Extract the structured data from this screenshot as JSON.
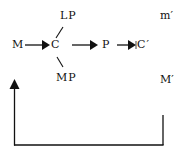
{
  "diagram": {
    "type": "circuit-of-capital flow diagram",
    "nodes": {
      "M": "M",
      "C": "C",
      "LP": "LP",
      "MP": "MP",
      "P": "P",
      "C_prime": "C′",
      "m_prime": "m′",
      "M_prime": "M′"
    },
    "edges": [
      {
        "from": "M",
        "to": "C",
        "style": "arrow"
      },
      {
        "from": "C",
        "to": "LP",
        "style": "line"
      },
      {
        "from": "C",
        "to": "MP",
        "style": "line"
      },
      {
        "from": "C",
        "to": "P",
        "style": "arrow"
      },
      {
        "from": "P",
        "to": "C′",
        "style": "arrow"
      },
      {
        "from": "M′",
        "to": "M",
        "style": "feedback-loop-arrow"
      }
    ],
    "colors": {
      "stroke": "#111111",
      "background": "#ffffff"
    }
  }
}
